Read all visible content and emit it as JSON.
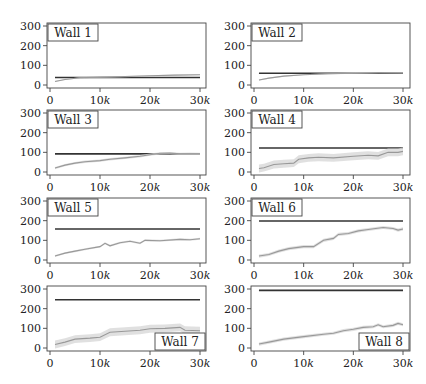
{
  "chart_data": [
    {
      "type": "line",
      "title": "Wall 1",
      "label_position": "top-left",
      "xlim": [
        0,
        30000
      ],
      "ylim": [
        0,
        300
      ],
      "xticks": [
        "0",
        "10k",
        "20k",
        "30k"
      ],
      "yticks": [
        "0",
        "100",
        "200",
        "300"
      ],
      "series": [
        {
          "name": "baseline",
          "color": "#333333",
          "x": [
            1000,
            30000
          ],
          "y": [
            38,
            38
          ]
        },
        {
          "name": "learning",
          "color": "#999999",
          "x": [
            1000,
            3000,
            6000,
            10000,
            15000,
            20000,
            25000,
            30000
          ],
          "y": [
            18,
            28,
            37,
            40,
            43,
            47,
            50,
            52
          ],
          "band": 3
        }
      ]
    },
    {
      "type": "line",
      "title": "Wall 2",
      "label_position": "top-left",
      "xlim": [
        0,
        30000
      ],
      "ylim": [
        0,
        300
      ],
      "xticks": [
        "0",
        "10k",
        "20k",
        "30k"
      ],
      "yticks": [
        "0",
        "100",
        "200",
        "300"
      ],
      "series": [
        {
          "name": "baseline",
          "color": "#333333",
          "x": [
            1000,
            30000
          ],
          "y": [
            60,
            60
          ]
        },
        {
          "name": "learning",
          "color": "#999999",
          "x": [
            1000,
            3000,
            6000,
            10000,
            15000,
            20000,
            25000,
            30000
          ],
          "y": [
            25,
            35,
            45,
            52,
            57,
            60,
            63,
            62
          ],
          "band": 3
        }
      ]
    },
    {
      "type": "line",
      "title": "Wall 3",
      "label_position": "top-left",
      "xlim": [
        0,
        30000
      ],
      "ylim": [
        0,
        300
      ],
      "xticks": [
        "0",
        "10k",
        "20k",
        "30k"
      ],
      "yticks": [
        "0",
        "100",
        "200",
        "300"
      ],
      "series": [
        {
          "name": "baseline",
          "color": "#333333",
          "x": [
            1000,
            30000
          ],
          "y": [
            92,
            92
          ]
        },
        {
          "name": "learning",
          "color": "#999999",
          "x": [
            1000,
            3000,
            5000,
            7000,
            10000,
            12000,
            15000,
            18000,
            20000,
            22000,
            24000,
            26000,
            28000,
            30000
          ],
          "y": [
            20,
            35,
            45,
            52,
            58,
            65,
            72,
            80,
            88,
            95,
            96,
            92,
            93,
            92
          ],
          "band": 6
        }
      ]
    },
    {
      "type": "line",
      "title": "Wall 4",
      "label_position": "top-left",
      "xlim": [
        0,
        30000
      ],
      "ylim": [
        0,
        300
      ],
      "xticks": [
        "0",
        "10k",
        "20k",
        "30k"
      ],
      "yticks": [
        "0",
        "100",
        "200",
        "300"
      ],
      "series": [
        {
          "name": "baseline",
          "color": "#333333",
          "x": [
            1000,
            30000
          ],
          "y": [
            122,
            122
          ]
        },
        {
          "name": "learning",
          "color": "#999999",
          "x": [
            1000,
            2000,
            4000,
            6000,
            8000,
            9000,
            11000,
            13000,
            16000,
            20000,
            23000,
            25000,
            27000,
            29000,
            30000
          ],
          "y": [
            18,
            22,
            38,
            42,
            45,
            65,
            72,
            75,
            72,
            80,
            85,
            82,
            100,
            100,
            105
          ],
          "band": 20
        }
      ]
    },
    {
      "type": "line",
      "title": "Wall 5",
      "label_position": "top-left",
      "xlim": [
        0,
        30000
      ],
      "ylim": [
        0,
        300
      ],
      "xticks": [
        "0",
        "10k",
        "20k",
        "30k"
      ],
      "yticks": [
        "0",
        "100",
        "200",
        "300"
      ],
      "series": [
        {
          "name": "baseline",
          "color": "#333333",
          "x": [
            1000,
            30000
          ],
          "y": [
            158,
            158
          ]
        },
        {
          "name": "learning",
          "color": "#999999",
          "x": [
            1000,
            3000,
            5000,
            7000,
            10000,
            11000,
            12000,
            14000,
            16000,
            18000,
            19000,
            22000,
            26000,
            28000,
            30000
          ],
          "y": [
            20,
            35,
            45,
            55,
            68,
            85,
            72,
            88,
            95,
            85,
            100,
            98,
            105,
            103,
            108
          ],
          "band": 5
        }
      ]
    },
    {
      "type": "line",
      "title": "Wall 6",
      "label_position": "top-left",
      "xlim": [
        0,
        30000
      ],
      "ylim": [
        0,
        300
      ],
      "xticks": [
        "0",
        "10k",
        "20k",
        "30k"
      ],
      "yticks": [
        "0",
        "100",
        "200",
        "300"
      ],
      "series": [
        {
          "name": "baseline",
          "color": "#333333",
          "x": [
            1000,
            30000
          ],
          "y": [
            198,
            198
          ]
        },
        {
          "name": "learning",
          "color": "#999999",
          "x": [
            1000,
            3000,
            5000,
            7000,
            10000,
            12000,
            14000,
            16000,
            17000,
            19000,
            21000,
            23000,
            26000,
            28000,
            29000,
            30000
          ],
          "y": [
            20,
            28,
            45,
            58,
            68,
            68,
            100,
            110,
            130,
            135,
            148,
            155,
            165,
            160,
            152,
            158
          ],
          "band": 8
        }
      ]
    },
    {
      "type": "line",
      "title": "Wall 7",
      "label_position": "bottom-right",
      "xlim": [
        0,
        30000
      ],
      "ylim": [
        0,
        300
      ],
      "xticks": [
        "0",
        "10k",
        "20k",
        "30k"
      ],
      "yticks": [
        "0",
        "100",
        "200",
        "300"
      ],
      "series": [
        {
          "name": "baseline",
          "color": "#333333",
          "x": [
            1000,
            30000
          ],
          "y": [
            245,
            245
          ]
        },
        {
          "name": "learning",
          "color": "#999999",
          "x": [
            1000,
            3000,
            5000,
            8000,
            10000,
            12000,
            15000,
            18000,
            20000,
            23000,
            26000,
            27000,
            30000
          ],
          "y": [
            18,
            30,
            45,
            50,
            55,
            80,
            85,
            90,
            98,
            100,
            105,
            90,
            88
          ],
          "band": 20
        }
      ]
    },
    {
      "type": "line",
      "title": "Wall 8",
      "label_position": "bottom-right",
      "xlim": [
        0,
        30000
      ],
      "ylim": [
        0,
        300
      ],
      "xticks": [
        "0",
        "10k",
        "20k",
        "30k"
      ],
      "yticks": [
        "0",
        "100",
        "200",
        "300"
      ],
      "series": [
        {
          "name": "baseline",
          "color": "#333333",
          "x": [
            1000,
            30000
          ],
          "y": [
            293,
            293
          ]
        },
        {
          "name": "learning",
          "color": "#999999",
          "x": [
            1000,
            3000,
            6000,
            10000,
            14000,
            16000,
            18000,
            20000,
            22000,
            24000,
            25000,
            26000,
            28000,
            29000,
            30000
          ],
          "y": [
            20,
            30,
            45,
            58,
            70,
            75,
            88,
            95,
            105,
            108,
            118,
            108,
            115,
            125,
            118
          ],
          "band": 8
        }
      ]
    }
  ]
}
